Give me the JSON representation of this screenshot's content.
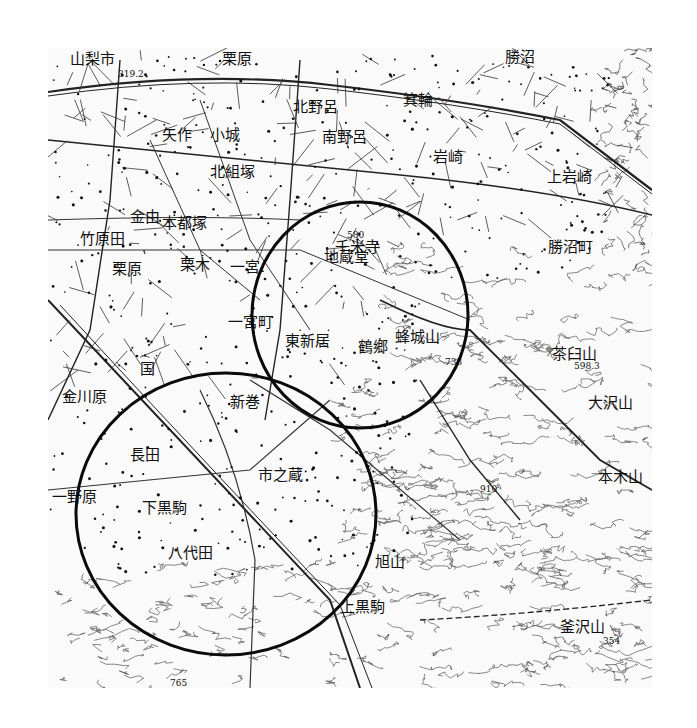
{
  "map": {
    "type": "topographic map (monochrome, Japanese)",
    "colors": {
      "ink": "#111111",
      "paper": "#fafafa",
      "background": "#ffffff",
      "circle": "#0a0a0a"
    },
    "labels": [
      {
        "id": "yamanashi-shi",
        "text": "山梨市",
        "x": 70,
        "y": 52
      },
      {
        "id": "kurihara",
        "text": "栗原",
        "x": 222,
        "y": 52
      },
      {
        "id": "minowa",
        "text": "箕輪",
        "x": 403,
        "y": 93
      },
      {
        "id": "katsunuma-top",
        "text": "勝沼",
        "x": 505,
        "y": 50
      },
      {
        "id": "yasaku",
        "text": "矢作",
        "x": 162,
        "y": 128
      },
      {
        "id": "kojo",
        "text": "小城",
        "x": 210,
        "y": 128
      },
      {
        "id": "kitanogo",
        "text": "北野呂",
        "x": 293,
        "y": 100
      },
      {
        "id": "minaminoro",
        "text": "南野呂",
        "x": 322,
        "y": 130
      },
      {
        "id": "iwasaki",
        "text": "岩崎",
        "x": 433,
        "y": 150
      },
      {
        "id": "kamiiwasaki",
        "text": "上岩崎",
        "x": 547,
        "y": 170
      },
      {
        "id": "kitakumizuka",
        "text": "北組塚",
        "x": 210,
        "y": 165
      },
      {
        "id": "kanayoshi",
        "text": "金由",
        "x": 130,
        "y": 210
      },
      {
        "id": "nakatsuka",
        "text": "本都塚",
        "x": 162,
        "y": 216
      },
      {
        "id": "takehara",
        "text": "竹原田",
        "x": 80,
        "y": 232
      },
      {
        "id": "kuruhara",
        "text": "栗原",
        "x": 112,
        "y": 262
      },
      {
        "id": "kuruki",
        "text": "栗木",
        "x": 180,
        "y": 258
      },
      {
        "id": "ichinomiya",
        "text": "一宮",
        "x": 230,
        "y": 260
      },
      {
        "id": "ichinomiya-machi",
        "text": "一宮町",
        "x": 228,
        "y": 315
      },
      {
        "id": "kokufu",
        "text": "国",
        "x": 140,
        "y": 362
      },
      {
        "id": "jizodo",
        "text": "地蔵堂",
        "x": 324,
        "y": 250
      },
      {
        "id": "kosojiki",
        "text": "千米寺",
        "x": 335,
        "y": 240
      },
      {
        "id": "higashi-niiyama",
        "text": "東新居",
        "x": 285,
        "y": 334
      },
      {
        "id": "tsuruga",
        "text": "鶴郷",
        "x": 358,
        "y": 340
      },
      {
        "id": "hachijoyama",
        "text": "蜂城山",
        "x": 395,
        "y": 330
      },
      {
        "id": "katsunuma-machi",
        "text": "勝沼町",
        "x": 548,
        "y": 240
      },
      {
        "id": "kaneyama",
        "text": "金川原",
        "x": 62,
        "y": 390
      },
      {
        "id": "niimaki",
        "text": "新巻",
        "x": 230,
        "y": 395
      },
      {
        "id": "nagata",
        "text": "長田",
        "x": 130,
        "y": 448
      },
      {
        "id": "ichinokura",
        "text": "市之蔵",
        "x": 258,
        "y": 468
      },
      {
        "id": "shimokurokoma",
        "text": "下黒駒",
        "x": 142,
        "y": 501
      },
      {
        "id": "hatsuhata",
        "text": "八代田",
        "x": 168,
        "y": 546
      },
      {
        "id": "kamikurokoma",
        "text": "上黒駒",
        "x": 340,
        "y": 600
      },
      {
        "id": "chausuyama",
        "text": "茶臼山",
        "x": 552,
        "y": 347
      },
      {
        "id": "osawayama",
        "text": "大沢山",
        "x": 588,
        "y": 396
      },
      {
        "id": "honkiyama",
        "text": "本木山",
        "x": 598,
        "y": 470
      },
      {
        "id": "asahiyama",
        "text": "旭山",
        "x": 375,
        "y": 555
      },
      {
        "id": "asohayama",
        "text": "釜沢山",
        "x": 560,
        "y": 620
      },
      {
        "id": "ichinoya",
        "text": "一野原",
        "x": 52,
        "y": 490
      }
    ],
    "spot_heights": [
      {
        "text": "319.2",
        "x": 118,
        "y": 70
      },
      {
        "text": "580",
        "x": 347,
        "y": 231
      },
      {
        "text": "733",
        "x": 445,
        "y": 358
      },
      {
        "text": "910",
        "x": 480,
        "y": 485
      },
      {
        "text": "598.3",
        "x": 574,
        "y": 362
      },
      {
        "text": "354",
        "x": 603,
        "y": 637
      },
      {
        "text": "765",
        "x": 170,
        "y": 679
      }
    ],
    "circles": [
      {
        "name": "upper-right-circle",
        "cx": 360,
        "cy": 315,
        "rx": 108,
        "ry": 113
      },
      {
        "name": "lower-left-circle",
        "cx": 226,
        "cy": 514,
        "rx": 150,
        "ry": 141
      }
    ]
  }
}
